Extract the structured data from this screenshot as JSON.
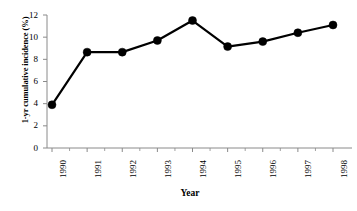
{
  "chart_data": {
    "type": "line",
    "title": "",
    "xlabel": "Year",
    "ylabel": "1-yr cumulative incidence (%)",
    "categories": [
      "1990",
      "1991",
      "1992",
      "1993",
      "1994",
      "1995",
      "1996",
      "1997",
      "1998"
    ],
    "x": [
      1990,
      1991,
      1992,
      1993,
      1994,
      1995,
      1996,
      1997,
      1998
    ],
    "values": [
      3.9,
      8.65,
      8.65,
      9.7,
      11.5,
      9.15,
      9.6,
      10.4,
      11.1
    ],
    "series": [
      {
        "name": "1-yr cumulative incidence",
        "values": [
          3.9,
          8.65,
          8.65,
          9.7,
          11.5,
          9.15,
          9.6,
          10.4,
          11.1
        ],
        "color": "#000000",
        "marker": "circle",
        "marker_size": 5.2,
        "line_width": 2.2
      }
    ],
    "ylim": [
      0,
      12
    ],
    "yticks": [
      0,
      2,
      4,
      6,
      8,
      10,
      12
    ],
    "ytick_labels": [
      "0",
      "2",
      "4",
      "6",
      "8",
      "10",
      "12"
    ],
    "xtick_labels": [
      "1990",
      "1991",
      "1992",
      "1993",
      "1994",
      "1995",
      "1996",
      "1997",
      "1998"
    ],
    "xtick_rotation": -90,
    "grid": false,
    "legend": false,
    "axis_color": "#8a8a8a",
    "background": "#ffffff"
  },
  "axes": {
    "y_title": "1-yr cumulative incidence (%)",
    "x_title": "Year"
  }
}
